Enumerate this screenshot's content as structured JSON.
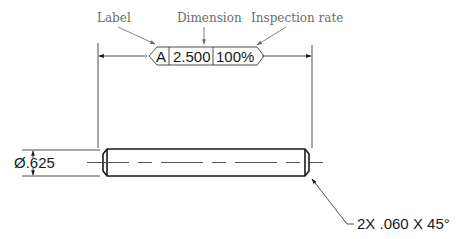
{
  "callouts": {
    "label": "Label",
    "dimension": "Dimension",
    "inspection_rate": "Inspection rate"
  },
  "balloon": {
    "label": "A",
    "dimension": "2.500",
    "inspection_rate": "100%"
  },
  "diameter_dimension": "Ø.625",
  "chamfer_note": "2X .060 X 45°",
  "colors": {
    "line": "#1a1a1a",
    "callout_text": "#6b6b6b",
    "callout_arrow": "#777777"
  }
}
